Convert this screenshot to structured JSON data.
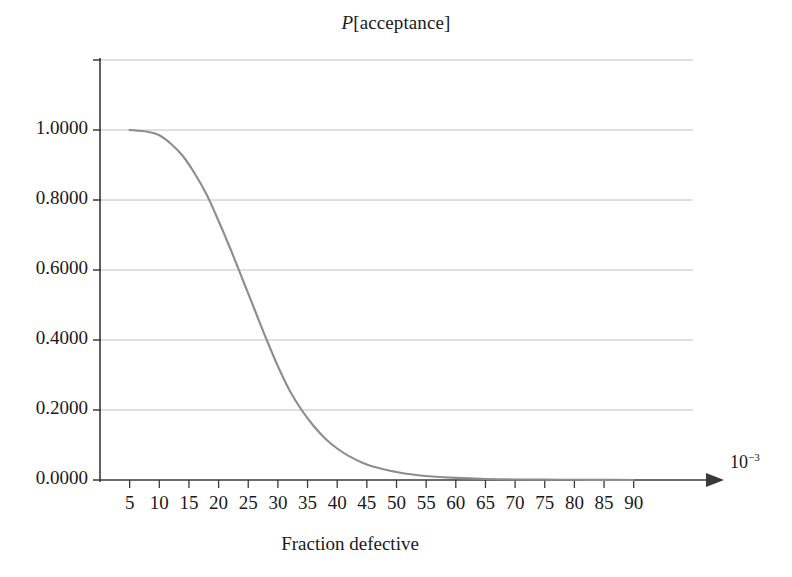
{
  "chart_data": {
    "type": "line",
    "title": "P[acceptance]",
    "title_parts": {
      "italic": "P",
      "rest": "[acceptance]"
    },
    "xlabel": "Fraction defective",
    "ylabel": "",
    "x_unit_label": "10",
    "x_unit_exponent": "−3",
    "xlim": [
      0,
      100
    ],
    "ylim": [
      0.0,
      1.2
    ],
    "grid": true,
    "grid_axis": "y",
    "legend": null,
    "legend_position": "none",
    "xticks": [
      5,
      10,
      15,
      20,
      25,
      30,
      35,
      40,
      45,
      50,
      55,
      60,
      65,
      70,
      75,
      80,
      85,
      90
    ],
    "xtick_labels": [
      "5",
      "10",
      "15",
      "20",
      "25",
      "30",
      "35",
      "40",
      "45",
      "50",
      "55",
      "60",
      "65",
      "70",
      "75",
      "80",
      "85",
      "90"
    ],
    "yticks": [
      0.0,
      0.2,
      0.4,
      0.6,
      0.8,
      1.0,
      1.2
    ],
    "ytick_labels": [
      "0.0000",
      "0.2000",
      "0.4000",
      "0.6000",
      "0.8000",
      "1.0000",
      ""
    ],
    "series": [
      {
        "name": "P[acceptance]",
        "color": "#8d8d8d",
        "x": [
          5,
          8,
          10,
          12,
          14,
          16,
          18,
          20,
          22,
          24,
          26,
          28,
          30,
          32,
          34,
          36,
          38,
          40,
          42,
          45,
          48,
          50,
          53,
          56,
          60,
          65,
          70,
          75,
          80,
          85,
          90
        ],
        "values": [
          1.0,
          0.995,
          0.985,
          0.96,
          0.925,
          0.875,
          0.815,
          0.74,
          0.66,
          0.575,
          0.49,
          0.405,
          0.325,
          0.255,
          0.2,
          0.155,
          0.118,
          0.09,
          0.068,
          0.044,
          0.03,
          0.023,
          0.015,
          0.01,
          0.006,
          0.003,
          0.0015,
          0.001,
          0.0005,
          0.0003,
          0.0002
        ]
      }
    ]
  },
  "axes_geometry": {
    "plot_left_px": 100,
    "plot_right_px": 693,
    "plot_top_px": 60,
    "plot_bottom_px": 480,
    "axis_arrow_end_px": 722
  }
}
